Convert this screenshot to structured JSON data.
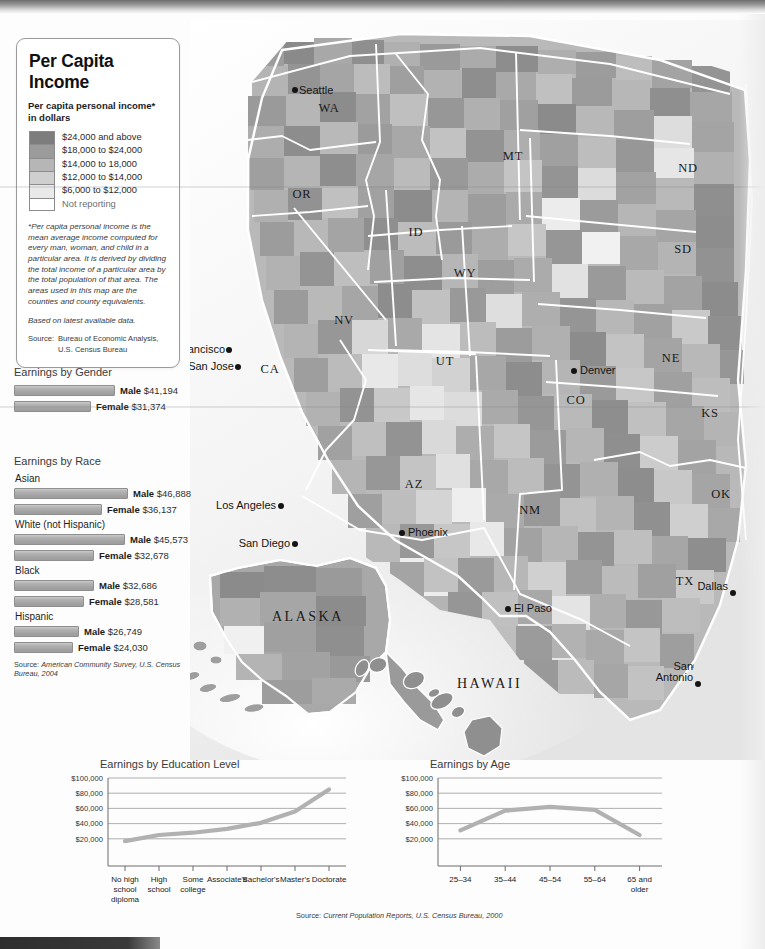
{
  "legend": {
    "title": "Per Capita Income",
    "subtitle": "Per capita personal income*\nin dollars",
    "classes": [
      {
        "label": "$24,000 and above",
        "color": "#7d7d7d"
      },
      {
        "label": "$18,000 to $24,000",
        "color": "#9b9b9b"
      },
      {
        "label": "$14,000 to 18,000",
        "color": "#b6b6b6"
      },
      {
        "label": "$12,000 to $14,000",
        "color": "#cfcfcf"
      },
      {
        "label": "$6,000 to $12,000",
        "color": "#e9e9e9"
      },
      {
        "label": "Not reporting",
        "color": "#ffffff"
      }
    ],
    "footnote": "*Per capita personal income is the mean average income computed for every man, woman, and child in a particular area. It is derived by dividing the total income of a particular area by the total population of that area. The areas used in this map are the counties and county equivalents.",
    "based_on": "Based on latest available data.",
    "source_label": "Source:",
    "source_value": "Bureau of Economic Analysis,\nU.S. Census Bureau"
  },
  "gender": {
    "heading": "Earnings by Gender",
    "rows": [
      {
        "sex": "Male",
        "value": "$41,194",
        "amount": 41194
      },
      {
        "sex": "Female",
        "value": "$31,374",
        "amount": 31374
      }
    ]
  },
  "race": {
    "heading": "Earnings by Race",
    "groups": [
      {
        "name": "Asian",
        "rows": [
          {
            "sex": "Male",
            "value": "$46,888",
            "amount": 46888
          },
          {
            "sex": "Female",
            "value": "$36,137",
            "amount": 36137
          }
        ]
      },
      {
        "name": "White (not Hispanic)",
        "rows": [
          {
            "sex": "Male",
            "value": "$45,573",
            "amount": 45573
          },
          {
            "sex": "Female",
            "value": "$32,678",
            "amount": 32678
          }
        ]
      },
      {
        "name": "Black",
        "rows": [
          {
            "sex": "Male",
            "value": "$32,686",
            "amount": 32686
          },
          {
            "sex": "Female",
            "value": "$28,581",
            "amount": 28581
          }
        ]
      },
      {
        "name": "Hispanic",
        "rows": [
          {
            "sex": "Male",
            "value": "$26,749",
            "amount": 26749
          },
          {
            "sex": "Female",
            "value": "$24,030",
            "amount": 24030
          }
        ]
      }
    ],
    "source_label": "Source:",
    "source_value": "American Community Survey, U.S. Census Bureau, 2004"
  },
  "charts_source_label": "Source:",
  "charts_source_value": "Current Population Reports, U.S. Census Bureau, 2000",
  "chart_data": [
    {
      "type": "line",
      "title": "Earnings by Education Level",
      "categories": [
        "No high school diploma",
        "High school",
        "Some college",
        "Associate's",
        "Bachelor's",
        "Master's",
        "Doctorate"
      ],
      "tick_labels": [
        [
          "No high",
          "school",
          "diploma"
        ],
        [
          "High",
          "school"
        ],
        [
          "Some",
          "college"
        ],
        [
          "Associate's"
        ],
        [
          "Bachelor's"
        ],
        [
          "Master's"
        ],
        [
          "Doctorate"
        ]
      ],
      "values": [
        17000,
        25000,
        28000,
        33000,
        41000,
        56000,
        85000
      ],
      "ylim": [
        0,
        100000
      ],
      "yticks": [
        20000,
        40000,
        60000,
        80000,
        100000
      ],
      "ytick_labels": [
        "$20,000",
        "$40,000",
        "$60,000",
        "$80,000",
        "$100,000"
      ],
      "xlabel": "",
      "ylabel": "",
      "grid": true,
      "legend": "none"
    },
    {
      "type": "line",
      "title": "Earnings by Age",
      "categories": [
        "25-34",
        "35-44",
        "45-54",
        "55-64",
        "65 and older"
      ],
      "tick_labels": [
        [
          "25–34"
        ],
        [
          "35–44"
        ],
        [
          "45–54"
        ],
        [
          "55–64"
        ],
        [
          "65 and",
          "older"
        ]
      ],
      "values": [
        31000,
        57000,
        62000,
        58000,
        25000
      ],
      "ylim": [
        0,
        100000
      ],
      "yticks": [
        20000,
        40000,
        60000,
        80000,
        100000
      ],
      "ytick_labels": [
        "$20,000",
        "$40,000",
        "$60,000",
        "$80,000",
        "$100,000"
      ],
      "xlabel": "",
      "ylabel": "",
      "grid": true,
      "legend": "none"
    }
  ],
  "map": {
    "states": [
      {
        "abbr": "WA",
        "x": 139,
        "y": 92
      },
      {
        "abbr": "OR",
        "x": 112,
        "y": 178
      },
      {
        "abbr": "ID",
        "x": 226,
        "y": 216
      },
      {
        "abbr": "MT",
        "x": 323,
        "y": 140
      },
      {
        "abbr": "ND",
        "x": 498,
        "y": 152
      },
      {
        "abbr": "SD",
        "x": 493,
        "y": 233
      },
      {
        "abbr": "NE",
        "x": 481,
        "y": 342
      },
      {
        "abbr": "KS",
        "x": 520,
        "y": 397
      },
      {
        "abbr": "WY",
        "x": 275,
        "y": 257
      },
      {
        "abbr": "NV",
        "x": 154,
        "y": 304
      },
      {
        "abbr": "UT",
        "x": 255,
        "y": 345
      },
      {
        "abbr": "CA",
        "x": 80,
        "y": 353
      },
      {
        "abbr": "CO",
        "x": 386,
        "y": 384
      },
      {
        "abbr": "AZ",
        "x": 224,
        "y": 468
      },
      {
        "abbr": "NM",
        "x": 340,
        "y": 494
      },
      {
        "abbr": "OK",
        "x": 531,
        "y": 478
      },
      {
        "abbr": "TX",
        "x": 495,
        "y": 565
      }
    ],
    "big_labels": [
      {
        "text": "ALASKA",
        "x": 82,
        "y": 601
      },
      {
        "text": "HAWAII",
        "x": 267,
        "y": 668
      }
    ],
    "cities": [
      {
        "name": "Seattle",
        "px": 105,
        "py": 70,
        "lx": 109,
        "ly": 74,
        "anchor": "start"
      },
      {
        "name": "San Francisco",
        "px": 39,
        "py": 330,
        "lx": 35,
        "ly": 333,
        "anchor": "end"
      },
      {
        "name": "San Jose",
        "px": 48,
        "py": 347,
        "lx": 44,
        "ly": 350,
        "anchor": "end"
      },
      {
        "name": "Los Angeles",
        "px": 91,
        "py": 486,
        "lx": 86,
        "ly": 489,
        "anchor": "end"
      },
      {
        "name": "San Diego",
        "px": 105,
        "py": 524,
        "lx": 100,
        "ly": 527,
        "anchor": "end"
      },
      {
        "name": "Denver",
        "px": 384,
        "py": 351,
        "lx": 390,
        "ly": 354,
        "anchor": "start"
      },
      {
        "name": "Phoenix",
        "px": 212,
        "py": 513,
        "lx": 218,
        "ly": 516,
        "anchor": "start"
      },
      {
        "name": "El Paso",
        "px": 318,
        "py": 589,
        "lx": 324,
        "ly": 592,
        "anchor": "start"
      },
      {
        "name": "Dallas",
        "px": 543,
        "py": 573,
        "lx": 538,
        "ly": 570,
        "anchor": "end"
      },
      {
        "name": "San Antonio",
        "px": 508,
        "py": 664,
        "lx": 503,
        "ly": 650,
        "anchor": "end"
      }
    ]
  }
}
